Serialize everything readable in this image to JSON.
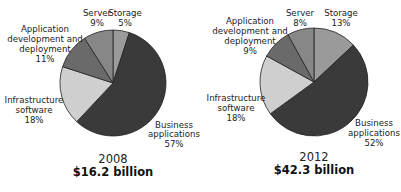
{
  "chart_data": [
    {
      "type": "pie",
      "title": "2008",
      "subtitle": "$16.2 billion",
      "categories": [
        "Storage",
        "Business applications",
        "Infrastructure software",
        "Application development and deployment",
        "Server"
      ],
      "values": [
        5,
        57,
        18,
        11,
        9
      ],
      "unit": "%",
      "colors": [
        "#9a9a9a",
        "#3a3a3a",
        "#cfcfcf",
        "#6a6a6a",
        "#878787"
      ],
      "start_angle": "top, clockwise",
      "legend": "none (direct labels)"
    },
    {
      "type": "pie",
      "title": "2012",
      "subtitle": "$42.3 billion",
      "categories": [
        "Storage",
        "Business applications",
        "Infrastructure software",
        "Application development and deployment",
        "Server"
      ],
      "values": [
        13,
        52,
        18,
        9,
        8
      ],
      "unit": "%",
      "colors": [
        "#9a9a9a",
        "#3a3a3a",
        "#cfcfcf",
        "#6a6a6a",
        "#878787"
      ],
      "start_angle": "top, clockwise",
      "legend": "none (direct labels)"
    }
  ],
  "pies": [
    {
      "year": "2008",
      "total": "$16.2 billion",
      "labels": {
        "server": [
          "Server",
          "9%"
        ],
        "storage": [
          "Storage",
          "5%"
        ],
        "appdev": [
          "Application",
          "development and",
          "deployment",
          "11%"
        ],
        "infra": [
          "Infrastructure",
          "software",
          "18%"
        ],
        "business": [
          "Business",
          "applications",
          "57%"
        ]
      }
    },
    {
      "year": "2012",
      "total": "$42.3 billion",
      "labels": {
        "server": [
          "Server",
          "8%"
        ],
        "storage": [
          "Storage",
          "13%"
        ],
        "appdev": [
          "Application",
          "development and",
          "deployment",
          "9%"
        ],
        "infra": [
          "Infrastructure",
          "software",
          "18%"
        ],
        "business": [
          "Business",
          "applications",
          "52%"
        ]
      }
    }
  ]
}
